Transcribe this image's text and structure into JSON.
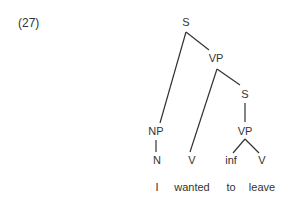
{
  "example_number": "(27)",
  "tree": {
    "nodes": [
      {
        "id": "S1",
        "label": "S",
        "x": 186,
        "y": 22
      },
      {
        "id": "VP1",
        "label": "VP",
        "x": 216,
        "y": 58
      },
      {
        "id": "S2",
        "label": "S",
        "x": 245,
        "y": 94
      },
      {
        "id": "NP",
        "label": "NP",
        "x": 156,
        "y": 131
      },
      {
        "id": "VP2",
        "label": "VP",
        "x": 245,
        "y": 131
      },
      {
        "id": "N",
        "label": "N",
        "x": 157,
        "y": 160
      },
      {
        "id": "V1",
        "label": "V",
        "x": 192,
        "y": 160
      },
      {
        "id": "INF",
        "label": "inf",
        "x": 231,
        "y": 160
      },
      {
        "id": "V2",
        "label": "V",
        "x": 262,
        "y": 160
      }
    ],
    "words": [
      {
        "text": "I",
        "x": 157,
        "y": 187
      },
      {
        "text": "wanted",
        "x": 192,
        "y": 187
      },
      {
        "text": "to",
        "x": 231,
        "y": 187
      },
      {
        "text": "leave",
        "x": 262,
        "y": 187
      }
    ],
    "edges": [
      [
        "S1",
        "VP1"
      ],
      [
        "S1",
        "NP"
      ],
      [
        "VP1",
        "V1"
      ],
      [
        "VP1",
        "S2"
      ],
      [
        "S2",
        "VP2"
      ],
      [
        "NP",
        "N"
      ],
      [
        "VP2",
        "INF"
      ],
      [
        "VP2",
        "V2"
      ]
    ]
  }
}
